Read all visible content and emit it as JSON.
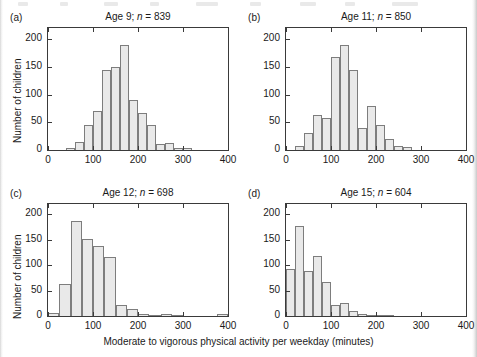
{
  "figure": {
    "xlabel": "Moderate to vigorous physical activity per weekday (minutes)",
    "ylabel": "Number of children",
    "bar_fill": "#e9e9e9",
    "bar_stroke": "#7d7d7d",
    "axis_color": "#3a3a3a"
  },
  "chart_data": [
    {
      "type": "bar",
      "panel": "a",
      "panel_tag": "(a)",
      "title": "Age 9; n = 839",
      "title_age": "Age 9;",
      "title_n_italic": "n",
      "title_n_value": "= 839",
      "xlabel": "Moderate to vigorous physical activity per weekday (minutes)",
      "ylabel": "Number of children",
      "xlim": [
        0,
        400
      ],
      "ylim": [
        0,
        220
      ],
      "xticks": [
        0,
        100,
        200,
        300,
        400
      ],
      "yticks": [
        0,
        50,
        100,
        150,
        200
      ],
      "grid": false,
      "bin_width": 20,
      "bin_starts": [
        40,
        60,
        80,
        100,
        120,
        140,
        160,
        180,
        200,
        220,
        240,
        260,
        280,
        300,
        320,
        340,
        360
      ],
      "values": [
        4,
        14,
        45,
        70,
        145,
        149,
        189,
        90,
        66,
        45,
        11,
        12,
        3,
        3,
        0,
        0,
        0
      ]
    },
    {
      "type": "bar",
      "panel": "b",
      "panel_tag": "(b)",
      "title": "Age 11; n = 850",
      "title_age": "Age 11;",
      "title_n_italic": "n",
      "title_n_value": "= 850",
      "xlim": [
        0,
        400
      ],
      "ylim": [
        0,
        220
      ],
      "xticks": [
        0,
        100,
        200,
        300,
        400
      ],
      "yticks": [
        0,
        50,
        100,
        150,
        200
      ],
      "grid": false,
      "bin_width": 20,
      "bin_starts": [
        20,
        40,
        60,
        80,
        100,
        120,
        140,
        160,
        180,
        200,
        220,
        240,
        260
      ],
      "values": [
        8,
        31,
        63,
        57,
        167,
        189,
        144,
        40,
        79,
        46,
        20,
        7,
        5
      ]
    },
    {
      "type": "bar",
      "panel": "c",
      "panel_tag": "(c)",
      "title": "Age 12; n = 698",
      "title_age": "Age 12;",
      "title_n_italic": "n",
      "title_n_value": "= 698",
      "xlim": [
        0,
        400
      ],
      "ylim": [
        0,
        220
      ],
      "xticks": [
        0,
        100,
        200,
        300,
        400
      ],
      "yticks": [
        0,
        50,
        100,
        150,
        200
      ],
      "grid": false,
      "bin_width": 25,
      "bin_starts": [
        0,
        25,
        50,
        75,
        100,
        125,
        150,
        175,
        200,
        225,
        250,
        275,
        300,
        325,
        350,
        375
      ],
      "values": [
        6,
        63,
        187,
        151,
        137,
        115,
        22,
        13,
        3,
        2,
        4,
        1,
        0,
        0,
        0,
        3
      ]
    },
    {
      "type": "bar",
      "panel": "d",
      "panel_tag": "(d)",
      "title": "Age 15; n = 604",
      "title_age": "Age 15;",
      "title_n_italic": "n",
      "title_n_value": "= 604",
      "xlim": [
        0,
        400
      ],
      "ylim": [
        0,
        220
      ],
      "xticks": [
        0,
        100,
        200,
        300,
        400
      ],
      "yticks": [
        0,
        50,
        100,
        150,
        200
      ],
      "grid": false,
      "bin_width": 20,
      "bin_starts": [
        0,
        20,
        40,
        60,
        80,
        100,
        120,
        140,
        160,
        180,
        200,
        220
      ],
      "values": [
        93,
        176,
        89,
        117,
        67,
        22,
        26,
        10,
        3,
        1,
        1,
        2
      ]
    }
  ]
}
